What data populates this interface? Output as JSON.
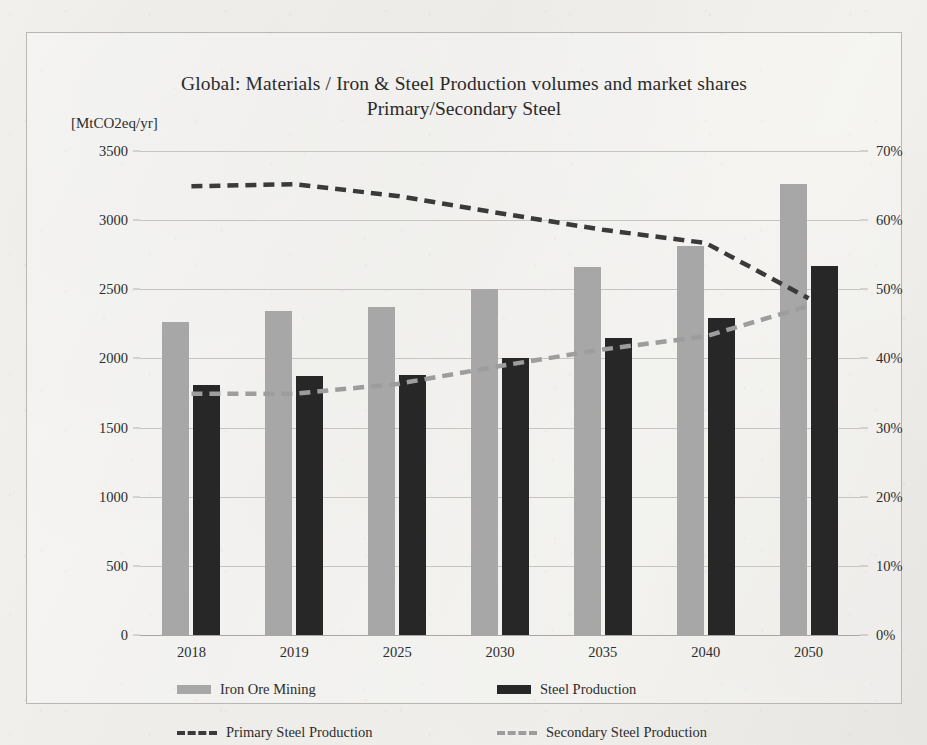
{
  "chart_data": {
    "type": "bar",
    "title": "Global: Materials / Iron & Steel  Production  volumes and market shares",
    "subtitle": "Primary/Secondary Steel",
    "ylabel": "[MtCO2eq/yr]",
    "xlabel": "",
    "categories": [
      "2018",
      "2019",
      "2025",
      "2030",
      "2035",
      "2040",
      "2050"
    ],
    "ylim": [
      0,
      3500
    ],
    "y2lim": [
      0,
      0.7
    ],
    "grid": true,
    "legend_position": "bottom",
    "yticks": [
      "0",
      "500",
      "1000",
      "1500",
      "2000",
      "2500",
      "3000",
      "3500"
    ],
    "ytick_values": [
      0,
      500,
      1000,
      1500,
      2000,
      2500,
      3000,
      3500
    ],
    "y2ticks": [
      "0%",
      "10%",
      "20%",
      "30%",
      "40%",
      "50%",
      "60%",
      "70%"
    ],
    "y2tick_values": [
      0,
      10,
      20,
      30,
      40,
      50,
      60,
      70
    ],
    "series": [
      {
        "name": "Iron Ore Mining",
        "kind": "bar",
        "axis": "left",
        "color": "#a7a7a7",
        "values": [
          2260,
          2340,
          2375,
          2500,
          2660,
          2815,
          3265
        ]
      },
      {
        "name": "Steel Production",
        "kind": "bar",
        "axis": "left",
        "color": "#272727",
        "values": [
          1805,
          1870,
          1880,
          2000,
          2145,
          2290,
          2670
        ]
      },
      {
        "name": "Primary Steel Production",
        "kind": "line-dashed",
        "axis": "right",
        "color": "#3a3a3a",
        "values": [
          64.9,
          65.2,
          63.5,
          61.0,
          58.6,
          56.7,
          48.7
        ]
      },
      {
        "name": "Secondary Steel Production",
        "kind": "line-dashed",
        "axis": "right",
        "color": "#9d9d9d",
        "values": [
          34.9,
          34.9,
          36.3,
          38.9,
          41.3,
          43.2,
          47.6
        ]
      }
    ]
  },
  "legend": {
    "items": [
      {
        "label": "Iron Ore Mining"
      },
      {
        "label": "Steel Production"
      },
      {
        "label": "Primary Steel Production"
      },
      {
        "label": "Secondary Steel Production"
      }
    ]
  }
}
